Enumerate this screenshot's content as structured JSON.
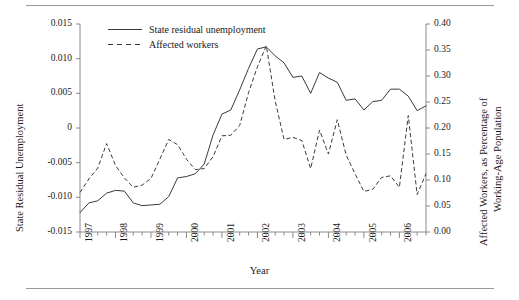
{
  "figure": {
    "x_axis_title": "Year",
    "y_axis_left_title": "State Residual Unemployment",
    "y_axis_right_title_line1": "Affected Workers, as Percentage of",
    "y_axis_right_title_line2": "Working-Age Population"
  },
  "legend": {
    "items": [
      {
        "label": "State residual unemployment",
        "style": "solid"
      },
      {
        "label": "Affected workers",
        "style": "dashed"
      }
    ]
  },
  "axes": {
    "left_ticks": [
      "0.015",
      "0.010",
      "0.005",
      "0",
      "-0.005",
      "-0.010",
      "-0.015"
    ],
    "right_ticks": [
      "0.40",
      "0.35",
      "0.30",
      "0.25",
      "0.20",
      "0.15",
      "0.10",
      "0.05",
      "0.00"
    ],
    "x_ticks": [
      "1997",
      "1998",
      "1999",
      "2000",
      "2001",
      "2002",
      "2003",
      "2004",
      "2005",
      "2006"
    ]
  },
  "chart_data": {
    "type": "line",
    "title": "",
    "xlabel": "Year",
    "ylabel": "State Residual Unemployment",
    "y2label": "Affected Workers, as Percentage of Working-Age Population",
    "grid": false,
    "legend_position": "top-left",
    "xlim": [
      1997.0,
      2006.75
    ],
    "ylim": [
      -0.015,
      0.015
    ],
    "y2lim": [
      0.0,
      0.4
    ],
    "x_tick_labels": [
      "1997",
      "1998",
      "1999",
      "2000",
      "2001",
      "2002",
      "2003",
      "2004",
      "2005",
      "2006"
    ],
    "x_tick_interval_minor": "quarterly",
    "x": [
      1997.0,
      1997.25,
      1997.5,
      1997.75,
      1998.0,
      1998.25,
      1998.5,
      1998.75,
      1999.0,
      1999.25,
      1999.5,
      1999.75,
      2000.0,
      2000.25,
      2000.5,
      2000.75,
      2001.0,
      2001.25,
      2001.5,
      2001.75,
      2002.0,
      2002.25,
      2002.5,
      2002.75,
      2003.0,
      2003.25,
      2003.5,
      2003.75,
      2004.0,
      2004.25,
      2004.5,
      2004.75,
      2005.0,
      2005.25,
      2005.5,
      2005.75,
      2006.0,
      2006.25,
      2006.5,
      2006.75
    ],
    "series": [
      {
        "name": "State residual unemployment",
        "axis": "left",
        "style": "solid",
        "values": [
          -0.0122,
          -0.0108,
          -0.0105,
          -0.0094,
          -0.009,
          -0.0091,
          -0.0108,
          -0.0112,
          -0.0111,
          -0.011,
          -0.0099,
          -0.0072,
          -0.007,
          -0.0066,
          -0.0052,
          -0.001,
          0.002,
          0.0026,
          0.0055,
          0.0086,
          0.0114,
          0.0117,
          0.0104,
          0.0094,
          0.0073,
          0.0075,
          0.005,
          0.008,
          0.0072,
          0.0066,
          0.004,
          0.0042,
          0.0026,
          0.0038,
          0.004,
          0.0056,
          0.0056,
          0.0046,
          0.0025,
          0.0032
        ]
      },
      {
        "name": "Affected workers",
        "axis": "right",
        "style": "dashed",
        "values": [
          0.076,
          0.102,
          0.123,
          0.17,
          0.128,
          0.104,
          0.086,
          0.09,
          0.103,
          0.14,
          0.178,
          0.168,
          0.14,
          0.12,
          0.122,
          0.145,
          0.185,
          0.186,
          0.205,
          0.268,
          0.318,
          0.358,
          0.252,
          0.178,
          0.182,
          0.176,
          0.122,
          0.196,
          0.15,
          0.216,
          0.148,
          0.112,
          0.078,
          0.082,
          0.105,
          0.108,
          0.086,
          0.224,
          0.072,
          0.112
        ]
      }
    ]
  }
}
